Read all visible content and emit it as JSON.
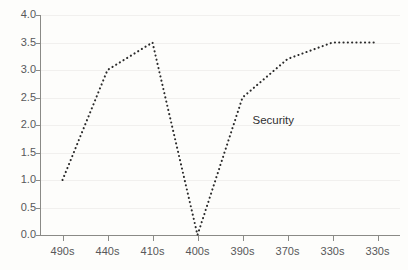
{
  "chart_data": {
    "type": "line",
    "title": "",
    "xlabel": "",
    "ylabel": "",
    "categories": [
      "490s",
      "440s",
      "410s",
      "400s",
      "390s",
      "370s",
      "330s",
      "330s"
    ],
    "series": [
      {
        "name": "Security",
        "values": [
          1.0,
          3.0,
          3.5,
          0.0,
          2.5,
          3.2,
          3.5,
          3.5
        ]
      }
    ],
    "ylim": [
      0.0,
      4.0
    ],
    "y_ticks": [
      "0.0",
      "0.5",
      "1.0",
      "1.5",
      "2.0",
      "2.5",
      "3.0",
      "3.5",
      "4.0"
    ],
    "y_tick_values": [
      0.0,
      0.5,
      1.0,
      1.5,
      2.0,
      2.5,
      3.0,
      3.5,
      4.0
    ],
    "grid": true,
    "legend_position": "inline-annotation",
    "annotations": [
      {
        "text": "Security",
        "x_value": "390s",
        "y_value": 2.1
      }
    ],
    "line_style": "dotted",
    "line_color": "#2b2b2b",
    "background_color": "#fdfdfb",
    "gridline_color": "#f1f0ee",
    "axis_color": "#8a8a86",
    "tick_label_color": "#58585a"
  }
}
